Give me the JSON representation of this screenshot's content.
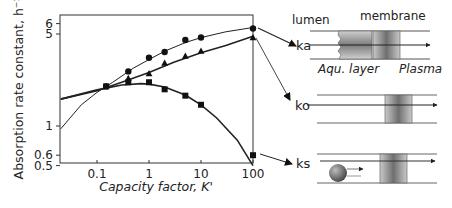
{
  "chart_data": {
    "type": "line",
    "title": "",
    "xlabel": "Capacity factor, K'",
    "ylabel": "Absorption rate constant, h⁻¹",
    "xscale": "log",
    "yscale": "log",
    "xlim": [
      0.02,
      100
    ],
    "ylim": [
      0.5,
      6.5
    ],
    "x_ticks": [
      "0.1",
      "1",
      "10",
      "100"
    ],
    "x_tick_values": [
      0.1,
      1,
      10,
      100
    ],
    "y_ticks": [
      "0.5",
      "0.6",
      "1",
      "5",
      "6"
    ],
    "y_tick_values": [
      0.5,
      0.6,
      1,
      5,
      6
    ],
    "grid": false,
    "legend": "none (series identified by arrows to diagram labels ka, ko, ks)",
    "series": [
      {
        "name": "ka",
        "marker": "circle",
        "points": [
          [
            0.15,
            2.0
          ],
          [
            0.4,
            2.6
          ],
          [
            1,
            3.3
          ],
          [
            2,
            3.65
          ],
          [
            5,
            4.5
          ],
          [
            10,
            4.7
          ],
          [
            100,
            5.5
          ]
        ],
        "curve": [
          [
            0.02,
            0.95
          ],
          [
            0.05,
            1.45
          ],
          [
            0.1,
            1.8
          ],
          [
            0.2,
            2.15
          ],
          [
            0.5,
            2.75
          ],
          [
            1,
            3.2
          ],
          [
            2,
            3.7
          ],
          [
            5,
            4.3
          ],
          [
            10,
            4.7
          ],
          [
            30,
            5.2
          ],
          [
            100,
            5.6
          ]
        ]
      },
      {
        "name": "ko",
        "marker": "triangle",
        "points": [
          [
            0.4,
            2.3
          ],
          [
            1,
            2.5
          ],
          [
            2,
            3.0
          ],
          [
            5,
            3.4
          ],
          [
            10,
            3.7
          ],
          [
            100,
            4.7
          ]
        ],
        "curve": [
          [
            0.02,
            1.6
          ],
          [
            0.1,
            1.85
          ],
          [
            0.3,
            2.15
          ],
          [
            1,
            2.55
          ],
          [
            3,
            3.05
          ],
          [
            10,
            3.6
          ],
          [
            30,
            4.1
          ],
          [
            100,
            4.8
          ]
        ]
      },
      {
        "name": "ks",
        "marker": "square",
        "points": [
          [
            0.15,
            2.0
          ],
          [
            0.4,
            2.15
          ],
          [
            1,
            2.15
          ],
          [
            2,
            1.9
          ],
          [
            5,
            1.7
          ],
          [
            10,
            1.45
          ],
          [
            100,
            0.6
          ]
        ],
        "curve": [
          [
            0.02,
            1.6
          ],
          [
            0.1,
            1.88
          ],
          [
            0.3,
            2.05
          ],
          [
            0.7,
            2.1
          ],
          [
            1,
            2.08
          ],
          [
            2,
            1.98
          ],
          [
            5,
            1.72
          ],
          [
            10,
            1.45
          ],
          [
            20,
            1.15
          ],
          [
            50,
            0.78
          ],
          [
            100,
            0.5
          ]
        ]
      }
    ]
  },
  "diagram": {
    "rows": [
      {
        "id": "ka",
        "label": "ka",
        "top_left_label": "lumen",
        "top_label": "membrane",
        "bottom_left_label": "Aqu. layer",
        "bottom_right_label": "Plasma"
      },
      {
        "id": "ko",
        "label": "ko"
      },
      {
        "id": "ks",
        "label": "ks"
      }
    ]
  }
}
